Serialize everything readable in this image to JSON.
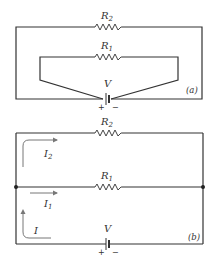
{
  "diagram_a": {
    "tag": "(a)",
    "resistor_top": {
      "name": "R",
      "sub": "2"
    },
    "resistor_inner": {
      "name": "R",
      "sub": "1"
    },
    "battery": {
      "label": "V",
      "plus": "+",
      "minus": "−"
    }
  },
  "diagram_b": {
    "tag": "(b)",
    "resistor_top": {
      "name": "R",
      "sub": "2"
    },
    "resistor_middle": {
      "name": "R",
      "sub": "1"
    },
    "battery": {
      "label": "V",
      "plus": "+",
      "minus": "−"
    },
    "currents": {
      "i2": {
        "name": "I",
        "sub": "2"
      },
      "i1": {
        "name": "I",
        "sub": "1"
      },
      "i": {
        "name": "I"
      }
    }
  },
  "colors": {
    "wire": "#333333",
    "arrow": "#777777",
    "background": "#ffffff"
  }
}
